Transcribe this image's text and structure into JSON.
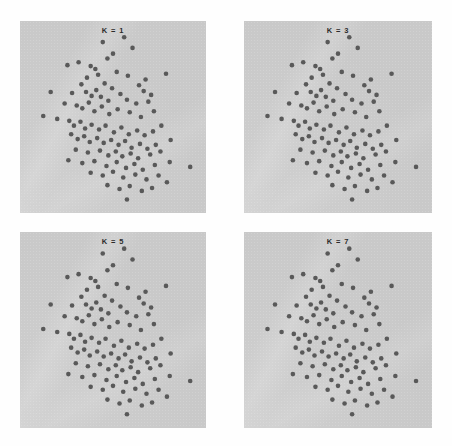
{
  "figure": {
    "title": "",
    "layout": "2x2 grid of scatter panels",
    "panel_bg_color": "#c9c9c9",
    "page_bg_color": "#ffffff",
    "point_color": "#595959",
    "label_color": "#2b2b2b"
  },
  "panels": [
    {
      "id": "panel-k1",
      "label": "K = 1",
      "k": 1
    },
    {
      "id": "panel-k3",
      "label": "K = 3",
      "k": 3
    },
    {
      "id": "panel-k5",
      "label": "K = 5",
      "k": 5
    },
    {
      "id": "panel-k7",
      "label": "K = 7",
      "k": 7
    }
  ],
  "chart_data": {
    "type": "scatter",
    "title": "",
    "subtitle": "",
    "xlabel": "",
    "ylabel": "",
    "xlim": [
      0,
      100
    ],
    "ylim": [
      0,
      100
    ],
    "grid": false,
    "legend": null,
    "axis_ticks": false,
    "marker": {
      "shape": "circle",
      "color": "#595959",
      "size_px": 4.6
    },
    "panels": [
      {
        "label": "K = 1",
        "k": 1,
        "n_points": 108
      },
      {
        "label": "K = 3",
        "k": 3,
        "n_points": 108
      },
      {
        "label": "K = 5",
        "k": 5,
        "n_points": 108
      },
      {
        "label": "K = 7",
        "k": 7,
        "n_points": 108
      }
    ],
    "note": "All four panels display the identical point cloud; only the K label differs.",
    "points": [
      [
        44.5,
        89.0
      ],
      [
        56.0,
        91.5
      ],
      [
        60.5,
        86.0
      ],
      [
        50.0,
        83.0
      ],
      [
        25.5,
        77.0
      ],
      [
        31.5,
        78.5
      ],
      [
        38.0,
        76.5
      ],
      [
        40.5,
        75.0
      ],
      [
        47.0,
        80.5
      ],
      [
        52.0,
        73.5
      ],
      [
        42.0,
        72.0
      ],
      [
        36.0,
        70.5
      ],
      [
        33.0,
        67.0
      ],
      [
        45.5,
        67.5
      ],
      [
        49.5,
        65.0
      ],
      [
        58.0,
        71.5
      ],
      [
        67.5,
        69.5
      ],
      [
        78.5,
        72.5
      ],
      [
        64.0,
        66.5
      ],
      [
        66.5,
        63.5
      ],
      [
        16.5,
        63.0
      ],
      [
        28.0,
        62.5
      ],
      [
        35.5,
        63.0
      ],
      [
        38.5,
        61.0
      ],
      [
        41.0,
        64.0
      ],
      [
        43.5,
        60.5
      ],
      [
        47.5,
        58.5
      ],
      [
        54.0,
        62.0
      ],
      [
        57.5,
        59.0
      ],
      [
        62.5,
        57.0
      ],
      [
        70.5,
        61.5
      ],
      [
        69.0,
        58.0
      ],
      [
        24.0,
        57.0
      ],
      [
        30.5,
        56.0
      ],
      [
        33.5,
        54.5
      ],
      [
        37.0,
        57.5
      ],
      [
        40.0,
        53.0
      ],
      [
        44.0,
        55.5
      ],
      [
        48.0,
        51.5
      ],
      [
        52.5,
        54.0
      ],
      [
        59.0,
        52.5
      ],
      [
        65.0,
        50.0
      ],
      [
        72.0,
        53.0
      ],
      [
        12.5,
        50.5
      ],
      [
        20.0,
        49.0
      ],
      [
        26.5,
        48.0
      ],
      [
        29.0,
        45.5
      ],
      [
        32.5,
        47.5
      ],
      [
        35.0,
        44.0
      ],
      [
        38.5,
        46.0
      ],
      [
        42.5,
        43.5
      ],
      [
        46.0,
        45.5
      ],
      [
        50.5,
        42.0
      ],
      [
        54.5,
        44.5
      ],
      [
        58.5,
        41.0
      ],
      [
        63.0,
        43.0
      ],
      [
        67.0,
        40.5
      ],
      [
        71.5,
        42.5
      ],
      [
        76.0,
        45.5
      ],
      [
        27.5,
        41.0
      ],
      [
        31.0,
        38.5
      ],
      [
        34.5,
        40.0
      ],
      [
        37.5,
        37.0
      ],
      [
        41.5,
        39.0
      ],
      [
        45.0,
        36.5
      ],
      [
        49.0,
        38.0
      ],
      [
        53.0,
        35.5
      ],
      [
        56.5,
        37.5
      ],
      [
        60.0,
        34.0
      ],
      [
        64.5,
        36.0
      ],
      [
        68.5,
        33.5
      ],
      [
        73.0,
        35.5
      ],
      [
        81.0,
        38.0
      ],
      [
        30.0,
        33.0
      ],
      [
        36.5,
        31.5
      ],
      [
        43.0,
        32.5
      ],
      [
        47.5,
        30.0
      ],
      [
        51.5,
        32.0
      ],
      [
        55.0,
        29.5
      ],
      [
        59.5,
        31.0
      ],
      [
        63.5,
        28.5
      ],
      [
        70.0,
        30.5
      ],
      [
        75.5,
        32.0
      ],
      [
        26.0,
        27.5
      ],
      [
        33.5,
        26.0
      ],
      [
        40.0,
        27.0
      ],
      [
        46.5,
        24.5
      ],
      [
        52.0,
        26.5
      ],
      [
        57.0,
        23.5
      ],
      [
        61.5,
        25.5
      ],
      [
        66.0,
        22.5
      ],
      [
        72.5,
        25.0
      ],
      [
        80.5,
        26.5
      ],
      [
        91.5,
        24.0
      ],
      [
        38.0,
        21.0
      ],
      [
        44.5,
        19.5
      ],
      [
        50.0,
        21.5
      ],
      [
        55.5,
        18.5
      ],
      [
        62.0,
        20.0
      ],
      [
        68.0,
        17.5
      ],
      [
        74.5,
        19.5
      ],
      [
        79.0,
        16.0
      ],
      [
        47.0,
        14.5
      ],
      [
        53.5,
        12.5
      ],
      [
        59.0,
        14.0
      ],
      [
        65.5,
        11.5
      ],
      [
        57.5,
        7.0
      ],
      [
        71.0,
        13.0
      ]
    ]
  }
}
